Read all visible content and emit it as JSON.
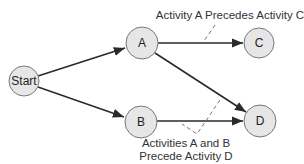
{
  "diagram": {
    "type": "activity-on-node precedence network",
    "nodes": [
      {
        "id": "start",
        "label": "Start",
        "cx": 24,
        "cy": 81,
        "r": 15
      },
      {
        "id": "a",
        "label": "A",
        "cx": 142,
        "cy": 43,
        "r": 16
      },
      {
        "id": "b",
        "label": "B",
        "cx": 141,
        "cy": 122,
        "r": 16
      },
      {
        "id": "c",
        "label": "C",
        "cx": 259,
        "cy": 43,
        "r": 15
      },
      {
        "id": "d",
        "label": "D",
        "cx": 260,
        "cy": 121,
        "r": 16
      }
    ],
    "edges": [
      {
        "from": "Start",
        "to": "A"
      },
      {
        "from": "Start",
        "to": "B"
      },
      {
        "from": "A",
        "to": "C"
      },
      {
        "from": "A",
        "to": "D"
      },
      {
        "from": "B",
        "to": "D"
      }
    ],
    "annotations": {
      "top": "Activity A Precedes Activity C",
      "bottom_line1": "Activities A and B",
      "bottom_line2": "Precede Activity D"
    },
    "colors": {
      "node_fill": "#e6e6e6",
      "node_stroke": "#777777",
      "edge": "#2a2a2a",
      "text": "#222222"
    }
  }
}
